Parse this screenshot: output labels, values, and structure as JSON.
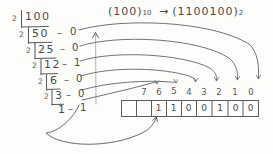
{
  "page": {
    "background_color": "#fdfdfc",
    "ink_color": "#4a4a4d"
  },
  "header": {
    "decimal_open": "(",
    "decimal_value": "100",
    "decimal_close": ")",
    "decimal_base": "10",
    "arrow": "→",
    "binary_open": "(",
    "binary_value": "1100100",
    "binary_close": ")",
    "binary_base": "2",
    "full_text": "(100)10 → (1100100)2"
  },
  "division": {
    "method": "repeated-division-by-2",
    "divisor": "2",
    "separator": "–",
    "rows": [
      {
        "divisor": "2",
        "quotient": "100",
        "remainder": ""
      },
      {
        "divisor": "2",
        "quotient": "50",
        "remainder": "0"
      },
      {
        "divisor": "2",
        "quotient": "25",
        "remainder": "0"
      },
      {
        "divisor": "2",
        "quotient": "12",
        "remainder": "1"
      },
      {
        "divisor": "2",
        "quotient": "6",
        "remainder": "0"
      },
      {
        "divisor": "2",
        "quotient": "3",
        "remainder": "0"
      },
      {
        "divisor": "",
        "quotient": "1",
        "remainder": "1"
      }
    ]
  },
  "bit_positions": {
    "labels": [
      "7",
      "6",
      "5",
      "4",
      "3",
      "2",
      "1",
      "0"
    ]
  },
  "bit_boxes": {
    "count": 9,
    "values": [
      "",
      "",
      "1",
      "1",
      "0",
      "0",
      "1",
      "0",
      "0"
    ]
  },
  "annotations": {
    "up_arrow": "vertical-read-up-arrow",
    "curved_arrows": "remainders-map-to-bit-positions",
    "bottom_arrow": "last-remainder-to-leading-bit"
  }
}
